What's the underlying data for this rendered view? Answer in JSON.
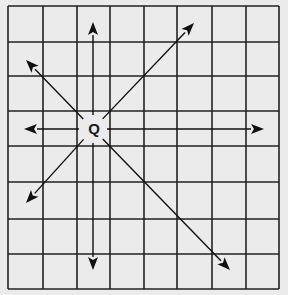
{
  "diagram": {
    "type": "grid-with-direction-arrows",
    "grid": {
      "columns": 8,
      "rows": 8,
      "x_lines": [
        8,
        43,
        77,
        110,
        144,
        177,
        212,
        246,
        279
      ],
      "y_lines": [
        6,
        42,
        76,
        111,
        146,
        182,
        219,
        254,
        289
      ],
      "line_color": "#222222",
      "background": "#ebebeb"
    },
    "center_point": {
      "label": "Q",
      "x": 93,
      "y": 129
    },
    "arrows": [
      {
        "name": "up",
        "x2": 93,
        "y2": 22
      },
      {
        "name": "down",
        "x2": 93,
        "y2": 270
      },
      {
        "name": "left",
        "x2": 24,
        "y2": 129
      },
      {
        "name": "right",
        "x2": 264,
        "y2": 129
      },
      {
        "name": "up-left",
        "x2": 26,
        "y2": 60
      },
      {
        "name": "up-right",
        "x2": 194,
        "y2": 23
      },
      {
        "name": "down-left",
        "x2": 26,
        "y2": 203
      },
      {
        "name": "down-right",
        "x2": 230,
        "y2": 270
      }
    ]
  }
}
